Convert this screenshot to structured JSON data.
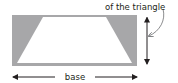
{
  "diagram": {
    "type": "geometry",
    "labels": {
      "top_text": "of the triangle",
      "base_text": "base"
    },
    "colors": {
      "triangle_fill": "#a7a7a9",
      "trapezoid_fill": "#ffffff",
      "stroke": "#231f20",
      "curve": "#6d6e71"
    },
    "shapes": {
      "rectangle": {
        "x": 12,
        "y": 15,
        "width": 125,
        "height": 51
      },
      "trapezoid": {
        "top_left": [
          43,
          17
        ],
        "top_right": [
          106,
          17
        ],
        "bottom_right": [
          132,
          63
        ],
        "bottom_left": [
          17,
          63
        ]
      },
      "height_arrow": {
        "x": 147,
        "y1": 17,
        "y2": 64
      },
      "base_arrow": {
        "y": 77,
        "x1": 13,
        "x2": 137
      }
    }
  }
}
